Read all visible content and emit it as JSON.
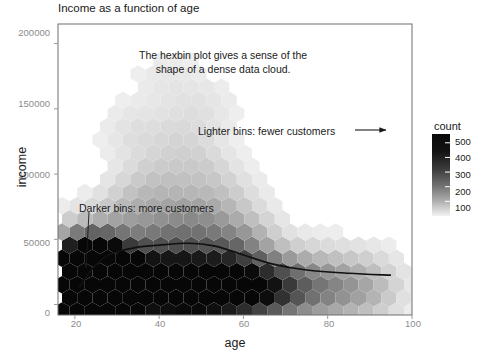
{
  "chart_data": {
    "type": "heatmap",
    "title": "Income as a function of age",
    "xlabel": "age",
    "ylabel": "income",
    "xlim": [
      16,
      100
    ],
    "ylim": [
      -8000,
      215000
    ],
    "xticks": [
      20,
      40,
      60,
      80,
      100
    ],
    "yticks": [
      0,
      50000,
      100000,
      150000,
      200000
    ],
    "xtick_labels": [
      "20",
      "40",
      "60",
      "80",
      "100"
    ],
    "ytick_labels": [
      "0",
      "50000",
      "100000",
      "150000",
      "200000"
    ],
    "grid": false,
    "legend_position": "right",
    "colorbar": {
      "title": "count",
      "ticks": [
        100,
        200,
        300,
        400,
        500
      ],
      "tick_labels": [
        "100",
        "200",
        "300",
        "400",
        "500"
      ],
      "vmin": 0,
      "vmax": 560,
      "low_color": "#f5f5f5",
      "high_color": "#0a0a0a",
      "direction": "dark-high"
    },
    "annotations": [
      {
        "name": "dense-cloud-note",
        "line1": "The hexbin plot gives a sense of the",
        "line2": "shape of a dense data cloud.",
        "x_px": 139,
        "y_px": 48
      },
      {
        "name": "lighter-bins-note",
        "text": "Lighter bins: fewer customers",
        "arrow": "right",
        "x_px": 198,
        "y_px": 124
      },
      {
        "name": "darker-bins-note",
        "text": "Darker bins: more customers",
        "arrow": "down-left",
        "x_px": 79,
        "y_px": 201
      }
    ],
    "trend_line": {
      "name": "smoothed-income-trend",
      "color": "#111111",
      "points": [
        {
          "age": 21,
          "income": 13000
        },
        {
          "age": 24,
          "income": 27000
        },
        {
          "age": 28,
          "income": 38000
        },
        {
          "age": 34,
          "income": 43500
        },
        {
          "age": 40,
          "income": 45500
        },
        {
          "age": 47,
          "income": 47000
        },
        {
          "age": 53,
          "income": 45000
        },
        {
          "age": 60,
          "income": 38000
        },
        {
          "age": 67,
          "income": 31000
        },
        {
          "age": 75,
          "income": 26500
        },
        {
          "age": 85,
          "income": 24000
        },
        {
          "age": 95,
          "income": 22500
        }
      ]
    },
    "hexbins": [
      {
        "age": 22.0,
        "income": 12000,
        "count": 560
      },
      {
        "age": 23.5,
        "income": 18000,
        "count": 540
      },
      {
        "age": 22.0,
        "income": 24000,
        "count": 470
      },
      {
        "age": 25.0,
        "income": 12000,
        "count": 500
      },
      {
        "age": 25.0,
        "income": 24000,
        "count": 430
      },
      {
        "age": 23.5,
        "income": 30000,
        "count": 360
      },
      {
        "age": 20.5,
        "income": 18000,
        "count": 330
      },
      {
        "age": 26.5,
        "income": 18000,
        "count": 420
      },
      {
        "age": 28.0,
        "income": 12000,
        "count": 300
      },
      {
        "age": 20.5,
        "income": 6000,
        "count": 250
      },
      {
        "age": 23.5,
        "income": 6000,
        "count": 300
      },
      {
        "age": 26.5,
        "income": 6000,
        "count": 260
      },
      {
        "age": 29.5,
        "income": 18000,
        "count": 230
      },
      {
        "age": 31.0,
        "income": 12000,
        "count": 210
      },
      {
        "age": 34.0,
        "income": 12000,
        "count": 240
      },
      {
        "age": 37.0,
        "income": 12000,
        "count": 250
      },
      {
        "age": 40.0,
        "income": 12000,
        "count": 270
      },
      {
        "age": 43.0,
        "income": 12000,
        "count": 280
      },
      {
        "age": 46.0,
        "income": 12000,
        "count": 300
      },
      {
        "age": 49.0,
        "income": 12000,
        "count": 290
      },
      {
        "age": 52.0,
        "income": 12000,
        "count": 300
      },
      {
        "age": 55.0,
        "income": 12000,
        "count": 270
      },
      {
        "age": 58.0,
        "income": 12000,
        "count": 250
      },
      {
        "age": 61.0,
        "income": 12000,
        "count": 200
      },
      {
        "age": 64.0,
        "income": 12000,
        "count": 170
      },
      {
        "age": 67.0,
        "income": 12000,
        "count": 150
      },
      {
        "age": 70.0,
        "income": 12000,
        "count": 120
      },
      {
        "age": 75.0,
        "income": 12000,
        "count": 90
      },
      {
        "age": 80.0,
        "income": 12000,
        "count": 70
      },
      {
        "age": 85.0,
        "income": 12000,
        "count": 50
      },
      {
        "age": 90.0,
        "income": 12000,
        "count": 35
      },
      {
        "age": 35.0,
        "income": 30000,
        "count": 150
      },
      {
        "age": 45.0,
        "income": 36000,
        "count": 140
      },
      {
        "age": 55.0,
        "income": 36000,
        "count": 130
      },
      {
        "age": 40.0,
        "income": 50000,
        "count": 90
      },
      {
        "age": 50.0,
        "income": 55000,
        "count": 85
      },
      {
        "age": 30.0,
        "income": 50000,
        "count": 80
      },
      {
        "age": 60.0,
        "income": 45000,
        "count": 75
      },
      {
        "age": 45.0,
        "income": 70000,
        "count": 45
      },
      {
        "age": 35.0,
        "income": 75000,
        "count": 35
      },
      {
        "age": 55.0,
        "income": 75000,
        "count": 30
      },
      {
        "age": 40.0,
        "income": 95000,
        "count": 22
      },
      {
        "age": 50.0,
        "income": 100000,
        "count": 20
      },
      {
        "age": 45.0,
        "income": 125000,
        "count": 12
      },
      {
        "age": 35.0,
        "income": 130000,
        "count": 8
      },
      {
        "age": 50.0,
        "income": 150000,
        "count": 6
      },
      {
        "age": 42.0,
        "income": 170000,
        "count": 4
      }
    ]
  },
  "legend": {
    "title": "count",
    "ticks": [
      "500",
      "400",
      "300",
      "200",
      "100"
    ]
  },
  "axes": {
    "x_label": "age",
    "y_label": "income",
    "x_ticks": [
      "20",
      "40",
      "60",
      "80",
      "100"
    ],
    "y_ticks": [
      "200000",
      "150000",
      "100000",
      "50000",
      "0"
    ]
  },
  "title": "Income as a function of age",
  "annotations": {
    "dense_line1": "The hexbin plot gives a sense of the",
    "dense_line2": "shape of a dense data cloud.",
    "lighter": "Lighter bins: fewer customers",
    "darker": "Darker bins: more customers"
  }
}
